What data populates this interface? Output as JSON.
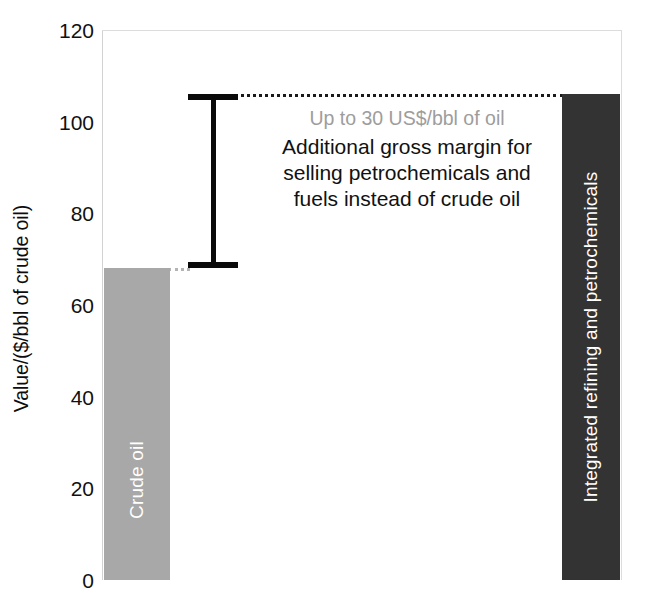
{
  "chart_data": {
    "type": "bar",
    "title": "",
    "subtitle": "",
    "xlabel": "",
    "ylabel": "Value/($/bbl of crude oil)",
    "ylim": [
      0,
      120
    ],
    "yticks": [
      0,
      20,
      40,
      60,
      80,
      100,
      120
    ],
    "ytick_labels": [
      "0",
      "20",
      "40",
      "60",
      "80",
      "100",
      "120"
    ],
    "grid": false,
    "legend": "none",
    "categories": [
      "Crude oil",
      "Integrated refining and petrochemicals"
    ],
    "values": [
      68,
      106
    ],
    "bar_colors": [
      "#a8a8a8",
      "#333333"
    ],
    "bar_label_color": "#ffffff",
    "annotations": [
      {
        "name": "gap-indicator",
        "kind": "range-bracket",
        "from_value": 68,
        "to_value": 106,
        "connector_style": "dotted"
      },
      {
        "name": "gap-callout",
        "headline": "Up to 30 US$/bbl of oil",
        "headline_color": "#9d9d9d",
        "body_lines": [
          "Additional gross margin for",
          "selling petrochemicals and",
          "fuels instead of crude oil"
        ],
        "body_color": "#111111"
      }
    ]
  },
  "axis": {
    "ylabel": "Value/($/bbl of crude oil)",
    "ticks": [
      {
        "label": "120",
        "value": 120
      },
      {
        "label": "100",
        "value": 100
      },
      {
        "label": "80",
        "value": 80
      },
      {
        "label": "60",
        "value": 60
      },
      {
        "label": "40",
        "value": 40
      },
      {
        "label": "20",
        "value": 20
      },
      {
        "label": "0",
        "value": 0
      }
    ]
  },
  "bars": {
    "crude": {
      "label": "Crude oil",
      "value": 68,
      "color": "#a8a8a8"
    },
    "integrated": {
      "label": "Integrated refining and petrochemicals",
      "value": 106,
      "color": "#333333"
    }
  },
  "callout": {
    "headline": "Up to 30 US$/bbl of oil",
    "line1": "Additional gross margin for",
    "line2": "selling petrochemicals and",
    "line3": "fuels instead of crude oil"
  }
}
